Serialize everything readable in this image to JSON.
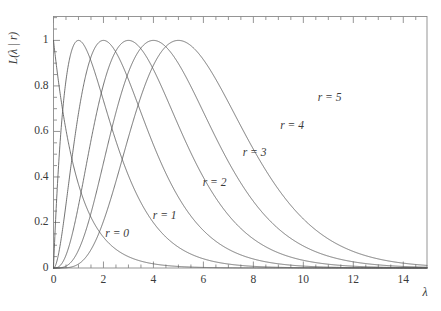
{
  "chart_data": {
    "type": "line",
    "title": "",
    "subtitle": "",
    "xlabel": "λ",
    "ylabel": "L(λ | r)",
    "xlim": [
      0,
      14.95
    ],
    "ylim": [
      0,
      1.105
    ],
    "grid": false,
    "legend_position": "inline-curve-labels",
    "x_major_ticks": [
      0,
      2,
      4,
      6,
      8,
      10,
      12,
      14
    ],
    "x_major_tick_labels": [
      "0",
      "2",
      "4",
      "6",
      "8",
      "10",
      "12",
      "14"
    ],
    "x_minor_tick_step": 0.5,
    "y_major_ticks": [
      0,
      0.2,
      0.4,
      0.6,
      0.8,
      1
    ],
    "y_major_tick_labels": [
      "0",
      "0.2",
      "0.4",
      "0.6",
      "0.8",
      "1"
    ],
    "y_minor_tick_step": 0.05,
    "curve_color": "#5a5a5a",
    "axis_color": "#8a8a8a",
    "formula": "L(lambda|r) = (lambda/r)^r * exp(r - lambda), normalized to peak 1",
    "series": [
      {
        "name": "r = 0",
        "r": 0,
        "peak_x": 0,
        "peak_y": 1,
        "label": "r = 0",
        "label_x": 2.55,
        "label_y": 0.148
      },
      {
        "name": "r = 1",
        "r": 1,
        "peak_x": 1,
        "peak_y": 1,
        "label": "r = 1",
        "label_x": 4.45,
        "label_y": 0.227
      },
      {
        "name": "r = 2",
        "r": 2,
        "peak_x": 2,
        "peak_y": 1,
        "label": "r = 2",
        "label_x": 6.45,
        "label_y": 0.375
      },
      {
        "name": "r = 3",
        "r": 3,
        "peak_x": 3,
        "peak_y": 1,
        "label": "r = 3",
        "label_x": 8.05,
        "label_y": 0.505
      },
      {
        "name": "r = 4",
        "r": 4,
        "peak_x": 4,
        "peak_y": 1,
        "label": "r = 4",
        "label_x": 9.55,
        "label_y": 0.625
      },
      {
        "name": "r = 5",
        "r": 5,
        "peak_x": 5,
        "peak_y": 1,
        "label": "r = 5",
        "label_x": 11.05,
        "label_y": 0.745
      }
    ]
  }
}
